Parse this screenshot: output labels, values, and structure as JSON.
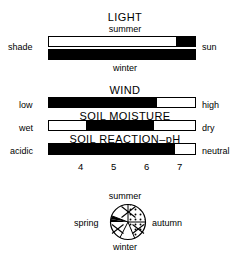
{
  "figure": {
    "kind": "ecological-requirement-bars",
    "bar_geometry": {
      "left_px": 48,
      "right_px": 196,
      "width_px": 148
    }
  },
  "sections": [
    {
      "id": "light",
      "title": "LIGHT",
      "top_caption": "summer",
      "bottom_caption": "winter",
      "left_label": "shade",
      "right_label": "sun",
      "bars": [
        {
          "name": "summer",
          "segments": [
            {
              "start_pct": 0,
              "end_pct": 100,
              "color": "#ffffff"
            },
            {
              "start_pct": 87,
              "end_pct": 100,
              "color": "#000000"
            }
          ]
        },
        {
          "name": "winter",
          "segments": [
            {
              "start_pct": 0,
              "end_pct": 100,
              "color": "#000000"
            }
          ]
        }
      ]
    },
    {
      "id": "wind",
      "title": "WIND",
      "left_label": "low",
      "right_label": "high",
      "bars": [
        {
          "name": "wind",
          "segments": [
            {
              "start_pct": 0,
              "end_pct": 74,
              "color": "#000000"
            }
          ]
        }
      ]
    },
    {
      "id": "soil-moisture",
      "title": "SOIL MOISTURE",
      "left_label": "wet",
      "right_label": "dry",
      "bars": [
        {
          "name": "soil-moisture",
          "segments": [
            {
              "start_pct": 25,
              "end_pct": 72,
              "color": "#000000"
            }
          ]
        }
      ]
    },
    {
      "id": "soil-reaction",
      "title": "SOIL REACTION–pH",
      "left_label": "acidic",
      "right_label": "neutral",
      "bars": [
        {
          "name": "soil-reaction-ph",
          "segments": [
            {
              "start_pct": 0,
              "end_pct": 86,
              "color": "#000000"
            }
          ]
        }
      ],
      "axis": {
        "ticks": [
          {
            "label": "4",
            "pos_pct": 18
          },
          {
            "label": "5",
            "pos_pct": 40
          },
          {
            "label": "6",
            "pos_pct": 62
          },
          {
            "label": "7",
            "pos_pct": 84
          }
        ]
      }
    }
  ],
  "season_wheel": {
    "name": "season-interest-wheel",
    "top_label": "summer",
    "bottom_label": "winter",
    "left_label": "spring",
    "right_label": "autumn",
    "wedges": [
      {
        "season": "summer",
        "fill": "stippled"
      },
      {
        "season": "autumn",
        "fill": "stippled"
      },
      {
        "season": "spring",
        "fill": "solid",
        "color": "#000000"
      },
      {
        "season": "winter",
        "fill": "white"
      }
    ]
  },
  "colors": {
    "ink": "#000000",
    "paper": "#ffffff"
  }
}
